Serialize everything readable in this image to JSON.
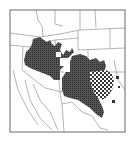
{
  "map": {
    "type": "species-distribution-map",
    "region": "Southwestern United States and northern Mexico",
    "colors": {
      "background": "#ffffff",
      "border_lines": "#555555",
      "range_fill": "#3a3a3a",
      "frame": "#444444"
    },
    "legend": [],
    "labels": [],
    "areas": [
      {
        "name": "primary-range",
        "pattern": "solid-stipple",
        "extent": "Nevada, Utah, Arizona, New Mexico, west Texas"
      },
      {
        "name": "secondary-range",
        "pattern": "checkered",
        "extent": "central Texas"
      }
    ]
  }
}
